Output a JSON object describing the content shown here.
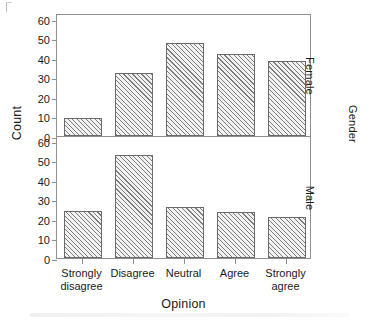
{
  "chart_data": {
    "type": "bar",
    "title": "",
    "xlabel": "Opinion",
    "ylabel": "Count",
    "categories": [
      "Strongly disagree",
      "Disagree",
      "Neutral",
      "Agree",
      "Strongly agree"
    ],
    "category_lines": [
      [
        "Strongly",
        "disagree"
      ],
      [
        "Disagree",
        ""
      ],
      [
        "Neutral",
        ""
      ],
      [
        "Agree",
        ""
      ],
      [
        "Strongly",
        "agree"
      ]
    ],
    "ylim": [
      0,
      63
    ],
    "yticks": [
      0,
      10,
      20,
      30,
      40,
      50,
      60
    ],
    "grid": false,
    "legend": "none",
    "panel_variable": "Gender",
    "panels": [
      {
        "label": "Female",
        "values": [
          9,
          32.5,
          47.5,
          42,
          38.5
        ]
      },
      {
        "label": "Male",
        "values": [
          24,
          53,
          26,
          23.5,
          21
        ]
      }
    ]
  },
  "figure": {
    "ylabel": "Count",
    "xlabel": "Opinion",
    "strip_outer_label": "Gender",
    "bar_fill_color": "#f2f2f2",
    "bar_hatch_color": "#7c7c7c",
    "bar_edge_color": "#6a6a6a",
    "axis_color": "#8e8e8e",
    "text_color": "#1a1a1a"
  }
}
